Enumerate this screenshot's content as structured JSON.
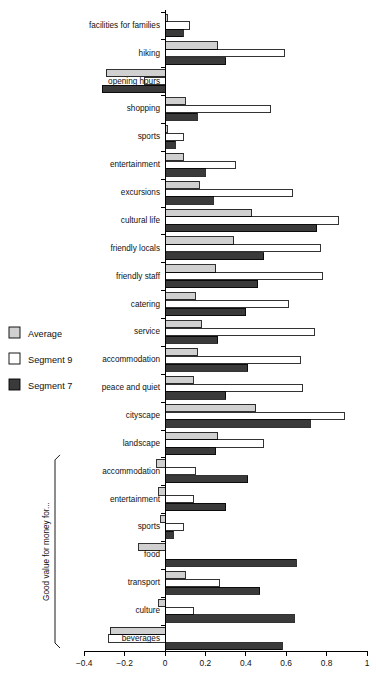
{
  "chart": {
    "type": "bar-horizontal-grouped",
    "title": "",
    "xlabel": "",
    "ylabel": "",
    "xlim": [
      -0.4,
      1
    ],
    "xticks": [
      -0.4,
      -0.2,
      0,
      0.2,
      0.4,
      0.6,
      0.8,
      1
    ],
    "xticklabels": [
      "−0.4",
      "−0.2",
      "0",
      "0.2",
      "0.4",
      "0.6",
      "0.8",
      "1"
    ],
    "grid": false,
    "legend_position": "left-middle",
    "orientation": "horizontal",
    "group_bracket_label": "Good value for money for..."
  },
  "legend": {
    "items": [
      {
        "label": "Average",
        "color": "#d0d0d0",
        "key": "average"
      },
      {
        "label": "Segment 9",
        "color": "#ffffff",
        "key": "segment9"
      },
      {
        "label": "Segment 7",
        "color": "#3a3a3a",
        "key": "segment7"
      }
    ]
  },
  "chart_data": {
    "type": "bar",
    "title": "",
    "xlabel": "",
    "ylabel": "",
    "xlim": [
      -0.4,
      1
    ],
    "xticks": [
      -0.4,
      -0.2,
      0,
      0.2,
      0.4,
      0.6,
      0.8,
      1
    ],
    "grid": false,
    "legend_position": "left",
    "orientation": "horizontal",
    "categories": [
      "facilities for families",
      "hiking",
      "opening hours",
      "shopping",
      "sports",
      "entertainment",
      "excursions",
      "cultural life",
      "friendly locals",
      "friendly staff",
      "catering",
      "service",
      "accommodation",
      "peace and quiet",
      "cityscape",
      "landscape",
      "accommodation",
      "entertainment",
      "sports",
      "food",
      "transport",
      "culture",
      "beverages"
    ],
    "group_bracket": {
      "label": "Good value for money for...",
      "from_index": 16,
      "to_index": 22
    },
    "series": [
      {
        "name": "Average",
        "color": "#d0d0d0",
        "values": [
          0.01,
          0.26,
          -0.29,
          0.1,
          0.01,
          0.09,
          0.17,
          0.43,
          0.34,
          0.25,
          0.15,
          0.18,
          0.16,
          0.14,
          0.45,
          0.26,
          -0.04,
          -0.03,
          -0.02,
          -0.13,
          0.1,
          -0.03,
          -0.27
        ]
      },
      {
        "name": "Segment 9",
        "color": "#ffffff",
        "values": [
          0.12,
          0.59,
          -0.1,
          0.52,
          0.09,
          0.35,
          0.63,
          0.86,
          0.77,
          0.78,
          0.61,
          0.74,
          0.67,
          0.68,
          0.89,
          0.49,
          0.15,
          0.14,
          0.09,
          0.0,
          0.27,
          0.14,
          -0.28
        ]
      },
      {
        "name": "Segment 7",
        "color": "#3a3a3a",
        "values": [
          0.09,
          0.3,
          -0.31,
          0.16,
          0.05,
          0.2,
          0.24,
          0.75,
          0.49,
          0.46,
          0.4,
          0.26,
          0.41,
          0.3,
          0.72,
          0.25,
          0.41,
          0.3,
          0.04,
          0.65,
          0.47,
          0.64,
          0.58
        ]
      }
    ]
  }
}
